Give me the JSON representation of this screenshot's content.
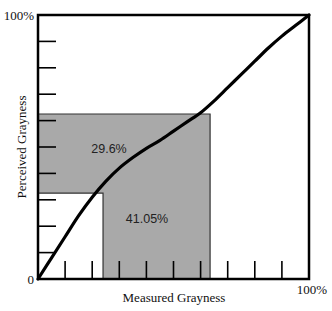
{
  "chart_data": {
    "type": "line",
    "title": "",
    "xlabel": "Measured Grayness",
    "ylabel": "Perceived Grayness",
    "xlim": [
      0,
      100
    ],
    "ylim": [
      0,
      100
    ],
    "x_tick_labels": {
      "start": "0",
      "end": "100%"
    },
    "y_tick_labels": {
      "start": "0",
      "end": "100%"
    },
    "x_ticks": [
      10,
      20,
      30,
      40,
      50,
      60,
      70,
      80,
      90
    ],
    "y_ticks": [
      10,
      20,
      30,
      40,
      50,
      60,
      70,
      80,
      90
    ],
    "grid": false,
    "legend": null,
    "series": [
      {
        "name": "Perceived vs Measured Grayness",
        "x": [
          0,
          5,
          10,
          15,
          20,
          25,
          30,
          35,
          40,
          45,
          50,
          55,
          60,
          65,
          70,
          75,
          80,
          85,
          90,
          95,
          100
        ],
        "y": [
          0,
          8,
          16,
          24,
          31,
          37,
          42,
          46,
          49.5,
          52.5,
          56,
          59.5,
          63,
          67.5,
          72.5,
          77.5,
          82.5,
          87.5,
          92,
          96,
          100
        ]
      }
    ],
    "annotations": [
      {
        "type": "shaded-region",
        "label": "29.6%",
        "description": "Perceived (vertical) span between curve points",
        "y_range": [
          32.5,
          62.5
        ],
        "x_range": [
          0,
          63.5
        ]
      },
      {
        "type": "shaded-region",
        "label": "41.05%",
        "description": "Measured (horizontal) span between curve points",
        "x_range": [
          24.0,
          63.5
        ],
        "y_range": [
          0,
          62.5
        ]
      }
    ],
    "colors": {
      "line": "#000000",
      "shade": "#a9a9a9",
      "axis": "#000000"
    }
  }
}
